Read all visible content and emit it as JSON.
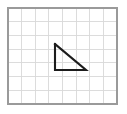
{
  "figure": {
    "background_color": "#ffffff",
    "canvas": {
      "width": 127,
      "height": 114
    }
  },
  "grid": {
    "name": "square-grid",
    "frame": {
      "x": 8,
      "y": 8,
      "width": 109,
      "height": 96
    },
    "columns": 8,
    "rows": 7,
    "cell_width": 13.625,
    "cell_height": 13.714,
    "line_color": "#d8d8d8",
    "line_width": 0.9,
    "border_color": "#9a9a9a",
    "border_width": 1.6
  },
  "shape": {
    "name": "right-triangle",
    "type": "polygon",
    "vertices": [
      {
        "label": "A",
        "x": 55,
        "y": 44
      },
      {
        "label": "B",
        "x": 55,
        "y": 70
      },
      {
        "label": "C",
        "x": 86,
        "y": 70
      }
    ],
    "points_attr": "55,44 55,70 86,70",
    "stroke_color": "#1c1c1c",
    "stroke_width": 2.1,
    "fill": "none",
    "right_angle_at": "B",
    "legs": {
      "vertical_cells": 2,
      "horizontal_cells": 2.25
    }
  }
}
